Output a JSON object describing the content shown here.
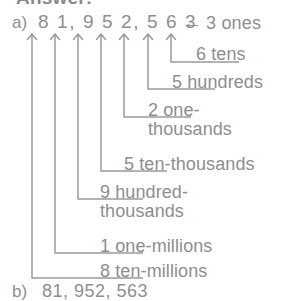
{
  "page": {
    "width": 292,
    "height": 299,
    "background": "#ffffff",
    "ink": "#8e8e8e"
  },
  "heading": {
    "text": "Answer:",
    "clipped": true
  },
  "parts": {
    "a": {
      "marker": "a)",
      "number_text": "8 1, 9 5 2, 5 6 3",
      "digits": [
        {
          "digit": "8",
          "place": "ten-millions"
        },
        {
          "digit": "1",
          "place": "one-millions"
        },
        {
          "digit": "9",
          "place": "hundred-thousands"
        },
        {
          "digit": "5",
          "place": "ten-thousands"
        },
        {
          "digit": "2",
          "place": "one-thousands"
        },
        {
          "digit": "5",
          "place": "hundreds"
        },
        {
          "digit": "6",
          "place": "tens"
        },
        {
          "digit": "3",
          "place": "ones"
        }
      ],
      "callouts": [
        {
          "id": "ones",
          "arrow_glyph": "←",
          "text": "3 ones",
          "style": "left-arrow"
        },
        {
          "id": "tens",
          "text": "6 tens",
          "style": "elbow"
        },
        {
          "id": "hundreds",
          "text": "5 hundreds",
          "style": "elbow"
        },
        {
          "id": "onethou",
          "text": "2 one-\nthousands",
          "style": "elbow"
        },
        {
          "id": "tenthou",
          "text": "5 ten-thousands",
          "style": "elbow"
        },
        {
          "id": "hunthou",
          "text": "9 hundred-\nthousands",
          "style": "elbow"
        },
        {
          "id": "onemil",
          "text": "1 one-millions",
          "style": "elbow"
        },
        {
          "id": "tenmil",
          "text": "8 ten-millions",
          "style": "elbow"
        }
      ]
    },
    "b": {
      "marker": "b)",
      "answer": "81, 952, 563"
    }
  }
}
